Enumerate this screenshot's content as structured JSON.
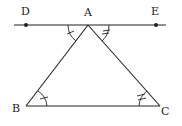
{
  "diagram": {
    "type": "geometry",
    "points": {
      "D": {
        "label": "D",
        "x": 26,
        "y": 25
      },
      "A": {
        "label": "A",
        "x": 88,
        "y": 25
      },
      "E": {
        "label": "E",
        "x": 156,
        "y": 25
      },
      "B": {
        "label": "B",
        "x": 26,
        "y": 106
      },
      "C": {
        "label": "C",
        "x": 160,
        "y": 106
      }
    },
    "segments": [
      "DE",
      "AB",
      "AC",
      "BC"
    ],
    "angle_marks": [
      {
        "angle": "DAB",
        "ticks": 1
      },
      {
        "angle": "ABC",
        "ticks": 1
      },
      {
        "angle": "EAC",
        "ticks": 2
      },
      {
        "angle": "ACB",
        "ticks": 2
      }
    ],
    "colors": {
      "stroke": "#222222",
      "background": "#ffffff"
    }
  }
}
